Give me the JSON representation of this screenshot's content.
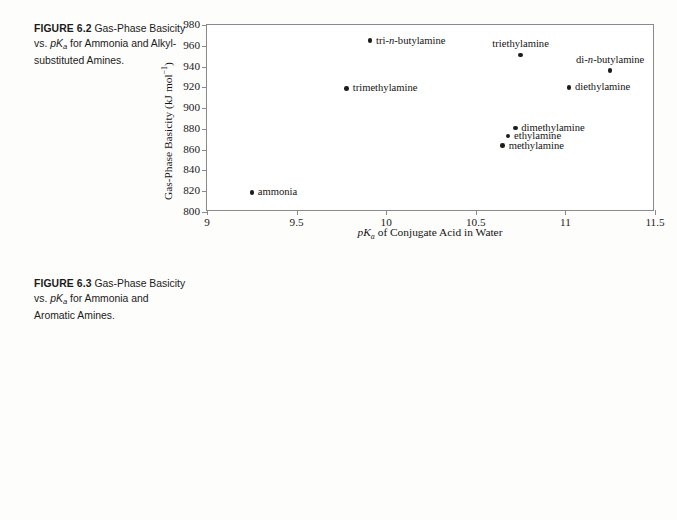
{
  "figures": [
    {
      "id": "figure-62",
      "caption": {
        "label": "FIGURE 6.2",
        "text_before": "Gas-Phase Basicity vs. ",
        "pka": "pK",
        "pka_sub": "a",
        "text_after": " for Ammonia and Alkyl-substituted Amines."
      }
    },
    {
      "id": "figure-63",
      "caption": {
        "label": "FIGURE 6.3",
        "text_before": "Gas-Phase Basicity vs. ",
        "pka": "pK",
        "pka_sub": "a",
        "text_after": " for Ammonia and Aromatic Amines."
      }
    }
  ],
  "axis_titles": {
    "y": "Gas-Phase Basicity (kJ mol",
    "y_sup": "−1",
    "y_close": ")",
    "x_pka": "pK",
    "x_pka_sub": "a",
    "x_rest": " of Conjugate Acid in Water"
  },
  "chart_data": [
    {
      "type": "scatter",
      "title": "FIGURE 6.2 Gas-Phase Basicity vs. pKa for Ammonia and Alkyl-substituted Amines.",
      "xlabel": "pKa of Conjugate Acid in Water",
      "ylabel": "Gas-Phase Basicity (kJ mol−1)",
      "xlim": [
        9,
        11.5
      ],
      "ylim": [
        800,
        980
      ],
      "xticks": [
        9,
        9.5,
        10,
        10.5,
        11,
        11.5
      ],
      "xtick_labels": [
        "9",
        "9.5",
        "10",
        "10.5",
        "11",
        "11.5"
      ],
      "yticks": [
        800,
        820,
        840,
        860,
        880,
        900,
        920,
        940,
        960,
        980
      ],
      "ytick_labels": [
        "800",
        "820",
        "840",
        "860",
        "880",
        "900",
        "920",
        "940",
        "960",
        "980"
      ],
      "grid": false,
      "legend": "none",
      "points": [
        {
          "label": "ammonia",
          "x": 9.25,
          "y": 819,
          "label_pos": "right"
        },
        {
          "label": "trimethylamine",
          "x": 9.78,
          "y": 919,
          "label_pos": "right"
        },
        {
          "label": "tri-n-butylamine",
          "x": 9.91,
          "y": 965,
          "label_pos": "right",
          "italic_part": "n"
        },
        {
          "label": "triethylamine",
          "x": 10.75,
          "y": 951,
          "label_pos": "above"
        },
        {
          "label": "methylamine",
          "x": 10.65,
          "y": 864,
          "label_pos": "right"
        },
        {
          "label": "ethylamine",
          "x": 10.68,
          "y": 873,
          "label_pos": "right"
        },
        {
          "label": "dimethylamine",
          "x": 10.72,
          "y": 881,
          "label_pos": "right"
        },
        {
          "label": "diethylamine",
          "x": 11.02,
          "y": 920,
          "label_pos": "right"
        },
        {
          "label": "di-n-butylamine",
          "x": 11.25,
          "y": 936,
          "label_pos": "above",
          "italic_part": "n"
        }
      ]
    },
    {
      "type": "scatter",
      "title": "FIGURE 6.3 Gas-Phase Basicity vs. pKa for Ammonia and Aromatic Amines.",
      "xlabel": "pKa of Conjugate Acid in Water",
      "ylabel": "Gas-Phase Basicity (kJ mol−1)",
      "xlim": [
        0,
        10
      ],
      "ylim": [
        800,
        940
      ],
      "xticks": [
        0,
        1,
        2,
        3,
        4,
        5,
        6,
        7,
        8,
        9,
        10
      ],
      "xtick_labels": [
        "0",
        "1",
        "2",
        "3",
        "4",
        "5",
        "6",
        "7",
        "8",
        "9",
        "10"
      ],
      "yticks": [
        800,
        820,
        840,
        860,
        880,
        900,
        920,
        940
      ],
      "ytick_labels": [
        "800",
        "820",
        "840",
        "860",
        "880",
        "900",
        "920",
        "940"
      ],
      "grid": false,
      "legend": "none",
      "points": [
        {
          "label": "2-chloropyridine",
          "x": 0.5,
          "y": 871,
          "label_pos": "below"
        },
        {
          "label": "2-bromopyridine",
          "x": 0.7,
          "y": 875,
          "label_pos": "above"
        },
        {
          "label": "3-bromopyridine",
          "x": 2.65,
          "y": 880,
          "label_pos": "right"
        },
        {
          "label": "aniline",
          "x": 4.4,
          "y": 853,
          "label_pos": "right"
        },
        {
          "label": "pyridine",
          "x": 5.0,
          "y": 899,
          "label_pos": "right"
        },
        {
          "label": "4-methylpyridine",
          "x": 5.85,
          "y": 917,
          "label_pos": "right"
        },
        {
          "label": "2,6-dimethylpyridine",
          "x": 6.5,
          "y": 928,
          "label_pos": "right"
        },
        {
          "label": "ammonia",
          "x": 9.1,
          "y": 822,
          "label_pos": "left"
        }
      ]
    }
  ]
}
